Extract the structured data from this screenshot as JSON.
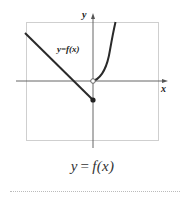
{
  "graph": {
    "x_axis_label": "x",
    "y_axis_label": "y",
    "curve_label": "y=f(x)",
    "line_color": "#2a2a2a",
    "axis_color": "#555555",
    "box_color": "#cccccc",
    "pieces": [
      {
        "type": "line",
        "description": "decreasing linear segment for x < 0",
        "endpoint": "filled dot at (0, negative)"
      },
      {
        "type": "curve",
        "description": "increasing concave-up curve for x > 0",
        "endpoint": "open circle at origin"
      }
    ]
  },
  "caption": {
    "lhs": "y",
    "eq": "=",
    "rhs": "f(x)"
  }
}
